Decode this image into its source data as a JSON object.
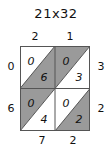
{
  "title": "21x32",
  "colors": {
    "shaded": "#9a9a9a",
    "unshaded": "#ffffff",
    "stroke": "#555555",
    "text": "#111111"
  },
  "lattice": {
    "rows": 2,
    "cols": 2,
    "diagonal_direction": "top-right-to-bottom-left",
    "top_labels": [
      "2",
      "1"
    ],
    "left_labels": [
      "0",
      "6"
    ],
    "right_labels": [
      "3",
      "2"
    ],
    "bottom_labels": [
      "7",
      "2"
    ],
    "cells": [
      {
        "row": 0,
        "col": 0,
        "upper": "0",
        "lower": "6",
        "upper_shaded": false,
        "lower_shaded": true
      },
      {
        "row": 0,
        "col": 1,
        "upper": "0",
        "lower": "3",
        "upper_shaded": true,
        "lower_shaded": false
      },
      {
        "row": 1,
        "col": 0,
        "upper": "0",
        "lower": "4",
        "upper_shaded": true,
        "lower_shaded": false
      },
      {
        "row": 1,
        "col": 1,
        "upper": "0",
        "lower": "2",
        "upper_shaded": false,
        "lower_shaded": true
      }
    ]
  }
}
